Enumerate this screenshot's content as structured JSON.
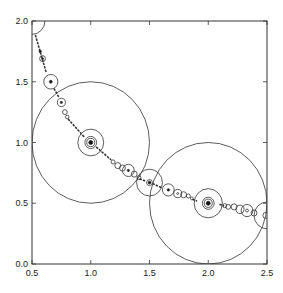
{
  "chart_data": {
    "type": "scatter",
    "title": "",
    "xlabel": "",
    "ylabel": "",
    "xlim": [
      0.5,
      2.5
    ],
    "ylim": [
      0.0,
      2.0
    ],
    "grid": false,
    "legend": null,
    "x_ticks": [
      0.5,
      1.0,
      1.5,
      2.0,
      2.5
    ],
    "x_tick_labels": [
      "0.5",
      "1.0",
      "1.5",
      "2.0",
      "2.5"
    ],
    "y_ticks": [
      0.0,
      0.5,
      1.0,
      1.5,
      2.0
    ],
    "y_tick_labels": [
      "0.0",
      "0.5",
      "1.0",
      "1.5",
      "2.0"
    ],
    "circles": [
      {
        "cx": 0.5,
        "cy": 2.0,
        "r": 0.11,
        "fill": false
      },
      {
        "cx": 1.0,
        "cy": 1.0,
        "r": 0.5,
        "fill": false
      },
      {
        "cx": 1.0,
        "cy": 1.0,
        "r": 0.11,
        "fill": false
      },
      {
        "cx": 1.0,
        "cy": 1.0,
        "r": 0.05,
        "fill": false
      },
      {
        "cx": 1.0,
        "cy": 1.0,
        "r": 0.034,
        "fill": false
      },
      {
        "cx": 1.0,
        "cy": 1.0,
        "r": 0.017,
        "fill": true
      },
      {
        "cx": 2.0,
        "cy": 0.5,
        "r": 0.5,
        "fill": false
      },
      {
        "cx": 2.0,
        "cy": 0.5,
        "r": 0.12,
        "fill": false
      },
      {
        "cx": 2.0,
        "cy": 0.5,
        "r": 0.05,
        "fill": false
      },
      {
        "cx": 2.0,
        "cy": 0.5,
        "r": 0.034,
        "fill": false
      },
      {
        "cx": 2.0,
        "cy": 0.5,
        "r": 0.017,
        "fill": true
      },
      {
        "cx": 1.5,
        "cy": 0.67,
        "r": 0.11,
        "fill": false
      },
      {
        "cx": 1.5,
        "cy": 0.67,
        "r": 0.025,
        "fill": false
      },
      {
        "cx": 1.5,
        "cy": 0.67,
        "r": 0.012,
        "fill": true
      },
      {
        "cx": 0.66,
        "cy": 1.5,
        "r": 0.06,
        "fill": false
      },
      {
        "cx": 0.66,
        "cy": 1.5,
        "r": 0.012,
        "fill": true
      },
      {
        "cx": 0.75,
        "cy": 1.33,
        "r": 0.034,
        "fill": false
      },
      {
        "cx": 0.75,
        "cy": 1.33,
        "r": 0.009,
        "fill": true
      },
      {
        "cx": 0.78,
        "cy": 1.25,
        "r": 0.02,
        "fill": false
      },
      {
        "cx": 0.8,
        "cy": 1.21,
        "r": 0.015,
        "fill": false
      },
      {
        "cx": 0.59,
        "cy": 1.69,
        "r": 0.025,
        "fill": false
      },
      {
        "cx": 0.59,
        "cy": 1.69,
        "r": 0.008,
        "fill": true
      },
      {
        "cx": 0.57,
        "cy": 1.75,
        "r": 0.01,
        "fill": true
      },
      {
        "cx": 1.19,
        "cy": 0.84,
        "r": 0.017,
        "fill": false
      },
      {
        "cx": 1.23,
        "cy": 0.81,
        "r": 0.025,
        "fill": false
      },
      {
        "cx": 1.27,
        "cy": 0.79,
        "r": 0.025,
        "fill": false
      },
      {
        "cx": 1.32,
        "cy": 0.77,
        "r": 0.05,
        "fill": false
      },
      {
        "cx": 1.32,
        "cy": 0.77,
        "r": 0.009,
        "fill": true
      },
      {
        "cx": 1.37,
        "cy": 0.74,
        "r": 0.025,
        "fill": false
      },
      {
        "cx": 1.41,
        "cy": 0.71,
        "r": 0.017,
        "fill": false
      },
      {
        "cx": 1.66,
        "cy": 0.61,
        "r": 0.05,
        "fill": false
      },
      {
        "cx": 1.66,
        "cy": 0.61,
        "r": 0.01,
        "fill": true
      },
      {
        "cx": 1.74,
        "cy": 0.58,
        "r": 0.034,
        "fill": false
      },
      {
        "cx": 1.74,
        "cy": 0.58,
        "r": 0.008,
        "fill": false
      },
      {
        "cx": 1.79,
        "cy": 0.57,
        "r": 0.025,
        "fill": false
      },
      {
        "cx": 1.83,
        "cy": 0.56,
        "r": 0.017,
        "fill": false
      },
      {
        "cx": 1.86,
        "cy": 0.54,
        "r": 0.012,
        "fill": false
      },
      {
        "cx": 2.14,
        "cy": 0.48,
        "r": 0.017,
        "fill": false
      },
      {
        "cx": 2.17,
        "cy": 0.47,
        "r": 0.02,
        "fill": false
      },
      {
        "cx": 2.22,
        "cy": 0.47,
        "r": 0.025,
        "fill": false
      },
      {
        "cx": 2.27,
        "cy": 0.45,
        "r": 0.034,
        "fill": false
      },
      {
        "cx": 2.33,
        "cy": 0.44,
        "r": 0.05,
        "fill": false
      },
      {
        "cx": 2.33,
        "cy": 0.44,
        "r": 0.012,
        "fill": false
      },
      {
        "cx": 2.39,
        "cy": 0.42,
        "r": 0.025,
        "fill": false
      },
      {
        "cx": 2.5,
        "cy": 0.4,
        "r": 0.11,
        "fill": false
      },
      {
        "cx": 2.49,
        "cy": 0.4,
        "r": 0.025,
        "fill": false
      }
    ],
    "dotted_segments": [
      {
        "from": [
          0.53,
          1.88
        ],
        "to": [
          0.62,
          1.58
        ]
      },
      {
        "from": [
          0.69,
          1.44
        ],
        "to": [
          0.73,
          1.37
        ]
      },
      {
        "from": [
          0.81,
          1.19
        ],
        "to": [
          0.95,
          1.04
        ]
      },
      {
        "from": [
          1.05,
          0.96
        ],
        "to": [
          1.17,
          0.86
        ]
      },
      {
        "from": [
          1.42,
          0.7
        ],
        "to": [
          1.47,
          0.68
        ]
      },
      {
        "from": [
          1.53,
          0.66
        ],
        "to": [
          1.6,
          0.63
        ]
      },
      {
        "from": [
          1.87,
          0.53
        ],
        "to": [
          1.9,
          0.52
        ]
      },
      {
        "from": [
          2.1,
          0.49
        ],
        "to": [
          2.13,
          0.48
        ]
      }
    ]
  }
}
